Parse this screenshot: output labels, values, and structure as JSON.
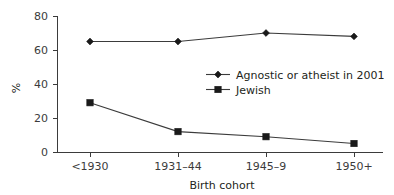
{
  "chart_data": {
    "type": "line",
    "title": "",
    "xlabel": "Birth cohort",
    "ylabel": "%",
    "categories": [
      "<1930",
      "1931–44",
      "1945–9",
      "1950+"
    ],
    "ylim": [
      0,
      80
    ],
    "yticks": [
      0,
      20,
      40,
      60,
      80
    ],
    "ytick_labels": [
      "0",
      "20",
      "40",
      "60",
      "80"
    ],
    "grid": false,
    "legend_position": "center-right",
    "series": [
      {
        "name": "Agnostic or atheist in 2001",
        "marker": "diamond",
        "color": "#1a1a1a",
        "values": [
          65,
          65,
          70,
          68
        ]
      },
      {
        "name": "Jewish",
        "marker": "square",
        "color": "#1a1a1a",
        "values": [
          29,
          12,
          9,
          5
        ]
      }
    ]
  },
  "axis": {
    "y_label": "%",
    "x_label": "Birth cohort",
    "y_tick_0": "0",
    "y_tick_1": "20",
    "y_tick_2": "40",
    "y_tick_3": "60",
    "y_tick_4": "80",
    "x_tick_0": "<1930",
    "x_tick_1": "1931–44",
    "x_tick_2": "1945–9",
    "x_tick_3": "1950+"
  },
  "legend": {
    "entry_0": "Agnostic or atheist in 2001",
    "entry_1": "Jewish"
  }
}
